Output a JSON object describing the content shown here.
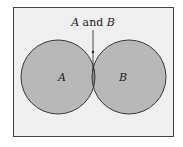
{
  "diagram": {
    "type": "venn",
    "sets": [
      {
        "id": "A",
        "label": "A"
      },
      {
        "id": "B",
        "label": "B"
      }
    ],
    "intersection": {
      "label_set1": "A",
      "label_word": " and ",
      "label_set2": "B"
    },
    "colors": {
      "background": "#efefef",
      "circle_fill": "#b8b8b8",
      "overlap_fill": "#8a8a8a",
      "stroke": "#3a3a3a"
    }
  }
}
